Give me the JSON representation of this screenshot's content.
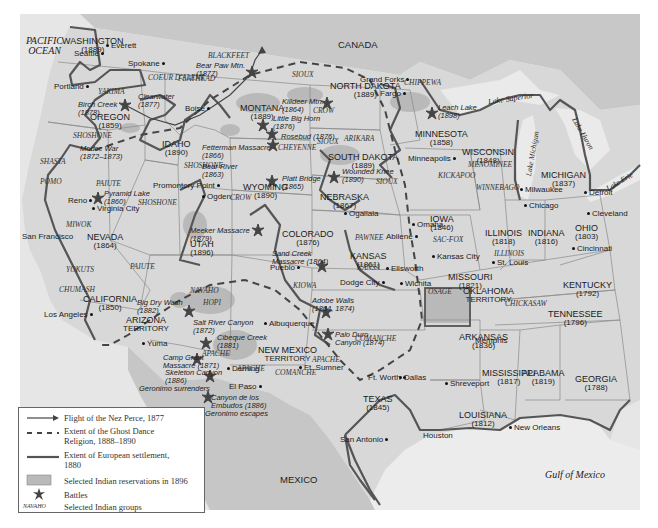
{
  "map": {
    "colors": {
      "land": "#d9d9d9",
      "water": "#ebebeb",
      "outside": "#c9c9c9",
      "reservation": "#b5b5b5",
      "settlement_line": "#555555",
      "border": "#8a8a8a"
    },
    "oceans": {
      "pacific_line1": "PACIFIC",
      "pacific_line2": "OCEAN",
      "gulf": "Gulf of Mexico"
    },
    "countries": {
      "canada": "CANADA",
      "mexico": "MEXICO"
    },
    "lakes": {
      "superior": "Lake Superior",
      "michigan": "Lake Michigan",
      "huron": "Lake Huron",
      "erie": "Lake Erie"
    },
    "states": [
      {
        "name": "WASHINGTON",
        "year": "(1889)",
        "x": 62,
        "y": 37
      },
      {
        "name": "OREGON",
        "year": "(1859)",
        "x": 90,
        "y": 113
      },
      {
        "name": "IDAHO",
        "year": "(1890)",
        "x": 162,
        "y": 140
      },
      {
        "name": "MONTANA",
        "year": "(1889)",
        "x": 240,
        "y": 104
      },
      {
        "name": "WYOMING",
        "year": "(1890)",
        "x": 243,
        "y": 183
      },
      {
        "name": "NORTH DAKOTA",
        "year": "(1889)",
        "x": 330,
        "y": 82
      },
      {
        "name": "SOUTH DAKOTA",
        "year": "(1889)",
        "x": 328,
        "y": 153
      },
      {
        "name": "NEBRASKA",
        "year": "(1867)",
        "x": 320,
        "y": 193
      },
      {
        "name": "MINNESOTA",
        "year": "(1858)",
        "x": 415,
        "y": 130
      },
      {
        "name": "WISCONSIN",
        "year": "(1848)",
        "x": 462,
        "y": 148
      },
      {
        "name": "MICHIGAN",
        "year": "(1837)",
        "x": 541,
        "y": 171
      },
      {
        "name": "IOWA",
        "year": "(1846)",
        "x": 430,
        "y": 215
      },
      {
        "name": "ILLINOIS",
        "year": "(1818)",
        "x": 485,
        "y": 229
      },
      {
        "name": "INDIANA",
        "year": "(1816)",
        "x": 528,
        "y": 229
      },
      {
        "name": "OHIO",
        "year": "(1803)",
        "x": 575,
        "y": 224
      },
      {
        "name": "NEVADA",
        "year": "(1864)",
        "x": 87,
        "y": 233
      },
      {
        "name": "UTAH",
        "year": "(1896)",
        "x": 190,
        "y": 240
      },
      {
        "name": "COLORADO",
        "year": "(1876)",
        "x": 282,
        "y": 230
      },
      {
        "name": "KANSAS",
        "year": "(1861)",
        "x": 350,
        "y": 252
      },
      {
        "name": "MISSOURI",
        "year": "(1821)",
        "x": 448,
        "y": 273
      },
      {
        "name": "KENTUCKY",
        "year": "(1792)",
        "x": 563,
        "y": 281
      },
      {
        "name": "TENNESSEE",
        "year": "(1796)",
        "x": 548,
        "y": 310
      },
      {
        "name": "CALIFORNIA",
        "year": "(1850)",
        "x": 83,
        "y": 295
      },
      {
        "name": "ARIZONA",
        "year": "TERRITORY",
        "x": 123,
        "y": 316
      },
      {
        "name": "OKLAHOMA",
        "year": "TERRITORY",
        "x": 463,
        "y": 287
      },
      {
        "name": "ARKANSAS",
        "year": "(1836)",
        "x": 459,
        "y": 333
      },
      {
        "name": "NEW MEXICO",
        "year": "TERRITORY",
        "x": 258,
        "y": 346
      },
      {
        "name": "MISSISSIPPI",
        "year": "(1817)",
        "x": 482,
        "y": 369
      },
      {
        "name": "ALABAMA",
        "year": "(1819)",
        "x": 522,
        "y": 369
      },
      {
        "name": "GEORGIA",
        "year": "(1788)",
        "x": 575,
        "y": 375
      },
      {
        "name": "TEXAS",
        "year": "(1845)",
        "x": 363,
        "y": 395
      },
      {
        "name": "LOUISIANA",
        "year": "(1812)",
        "x": 459,
        "y": 411
      }
    ],
    "cities": [
      {
        "name": "Everett",
        "x": 104,
        "y": 42,
        "dot": "left"
      },
      {
        "name": "Seattle",
        "x": 74,
        "y": 50,
        "dot": "right"
      },
      {
        "name": "Spokane",
        "x": 128,
        "y": 60,
        "dot": "right"
      },
      {
        "name": "Portland",
        "x": 54,
        "y": 83,
        "dot": "right"
      },
      {
        "name": "Boise",
        "x": 185,
        "y": 105,
        "dot": "right"
      },
      {
        "name": "Grand Forks",
        "x": 360,
        "y": 76,
        "dot": "right"
      },
      {
        "name": "Fargo",
        "x": 380,
        "y": 90,
        "dot": "right"
      },
      {
        "name": "Minneapolis",
        "x": 408,
        "y": 155,
        "dot": "right"
      },
      {
        "name": "Milwaukee",
        "x": 518,
        "y": 186,
        "dot": "left"
      },
      {
        "name": "Chicago",
        "x": 522,
        "y": 202,
        "dot": "left"
      },
      {
        "name": "Detroit",
        "x": 582,
        "y": 189,
        "dot": "left"
      },
      {
        "name": "Cleveland",
        "x": 585,
        "y": 210,
        "dot": "left"
      },
      {
        "name": "Omaha",
        "x": 410,
        "y": 221,
        "dot": "left"
      },
      {
        "name": "Kansas City",
        "x": 430,
        "y": 253,
        "dot": "left"
      },
      {
        "name": "St. Louis",
        "x": 490,
        "y": 259,
        "dot": "left"
      },
      {
        "name": "Cincinnati",
        "x": 570,
        "y": 245,
        "dot": "left"
      },
      {
        "name": "Promontory Point",
        "x": 153,
        "y": 182,
        "dot": "right"
      },
      {
        "name": "Ogden",
        "x": 200,
        "y": 193,
        "dot": "left"
      },
      {
        "name": "Reno",
        "x": 68,
        "y": 197,
        "dot": "right"
      },
      {
        "name": "Virginia City",
        "x": 90,
        "y": 205,
        "dot": "left"
      },
      {
        "name": "San Francisco",
        "x": 22,
        "y": 233,
        "dot": "top"
      },
      {
        "name": "Pueblo",
        "x": 270,
        "y": 264,
        "dot": "right"
      },
      {
        "name": "Ogallala",
        "x": 342,
        "y": 210,
        "dot": "left"
      },
      {
        "name": "Abilene",
        "x": 386,
        "y": 233,
        "dot": "right"
      },
      {
        "name": "Ellsworth",
        "x": 384,
        "y": 265,
        "dot": "left"
      },
      {
        "name": "Wichita",
        "x": 398,
        "y": 280,
        "dot": "left"
      },
      {
        "name": "Dodge City",
        "x": 340,
        "y": 279,
        "dot": "right"
      },
      {
        "name": "Los Angeles",
        "x": 44,
        "y": 311,
        "dot": "right"
      },
      {
        "name": "Yuma",
        "x": 140,
        "y": 340,
        "dot": "left"
      },
      {
        "name": "Albuquerque",
        "x": 262,
        "y": 320,
        "dot": "left"
      },
      {
        "name": "Deming",
        "x": 225,
        "y": 365,
        "dot": "left"
      },
      {
        "name": "El Paso",
        "x": 229,
        "y": 383,
        "dot": "right"
      },
      {
        "name": "Ft. Sumner",
        "x": 297,
        "y": 364,
        "dot": "left"
      },
      {
        "name": "Ft. Worth",
        "x": 368,
        "y": 374,
        "dot": "right"
      },
      {
        "name": "Dallas",
        "x": 397,
        "y": 374,
        "dot": "left"
      },
      {
        "name": "Shreveport",
        "x": 443,
        "y": 380,
        "dot": "left"
      },
      {
        "name": "Memphis",
        "x": 475,
        "y": 337,
        "dot": "top"
      },
      {
        "name": "San Antonio",
        "x": 340,
        "y": 436,
        "dot": "right"
      },
      {
        "name": "Houston",
        "x": 423,
        "y": 432,
        "dot": "top"
      },
      {
        "name": "New Orleans",
        "x": 507,
        "y": 424,
        "dot": "left"
      }
    ],
    "groups": [
      {
        "name": "BLACKFEET",
        "x": 208,
        "y": 52
      },
      {
        "name": "FLATHEAD",
        "x": 178,
        "y": 75
      },
      {
        "name": "COEUR D'ALENE",
        "x": 148,
        "y": 74
      },
      {
        "name": "YAKIMA",
        "x": 98,
        "y": 88
      },
      {
        "name": "SIOUX",
        "x": 292,
        "y": 71
      },
      {
        "name": "CROW",
        "x": 313,
        "y": 107
      },
      {
        "name": "SIOUX",
        "x": 317,
        "y": 138
      },
      {
        "name": "CHEYENNE",
        "x": 278,
        "y": 144
      },
      {
        "name": "ARIKARA",
        "x": 344,
        "y": 135
      },
      {
        "name": "CHIPPEWA",
        "x": 404,
        "y": 79
      },
      {
        "name": "SHOSHONE",
        "x": 73,
        "y": 132
      },
      {
        "name": "SHOSHONE",
        "x": 184,
        "y": 162
      },
      {
        "name": "SHASTA",
        "x": 40,
        "y": 158
      },
      {
        "name": "POMO",
        "x": 40,
        "y": 178
      },
      {
        "name": "PAIUTE",
        "x": 96,
        "y": 180
      },
      {
        "name": "SHOSHONE",
        "x": 138,
        "y": 199
      },
      {
        "name": "CROW",
        "x": 230,
        "y": 194
      },
      {
        "name": "MENOMINEE",
        "x": 468,
        "y": 161
      },
      {
        "name": "KICKAPOO",
        "x": 438,
        "y": 172
      },
      {
        "name": "WINNEBAGO",
        "x": 476,
        "y": 184
      },
      {
        "name": "SIOUX",
        "x": 376,
        "y": 178
      },
      {
        "name": "MIWOK",
        "x": 66,
        "y": 221
      },
      {
        "name": "PAIUTE",
        "x": 130,
        "y": 263
      },
      {
        "name": "YOKUTS",
        "x": 66,
        "y": 266
      },
      {
        "name": "CHUMASH",
        "x": 59,
        "y": 286
      },
      {
        "name": "PAWNEE",
        "x": 355,
        "y": 234
      },
      {
        "name": "SAC-FOX",
        "x": 433,
        "y": 236
      },
      {
        "name": "ILLINOIS",
        "x": 494,
        "y": 250
      },
      {
        "name": "KANSA",
        "x": 357,
        "y": 264
      },
      {
        "name": "OSAGE",
        "x": 428,
        "y": 288
      },
      {
        "name": "KIOWA",
        "x": 293,
        "y": 282
      },
      {
        "name": "NAVAHO",
        "x": 190,
        "y": 287
      },
      {
        "name": "HOPI",
        "x": 203,
        "y": 299
      },
      {
        "name": "CHICKASAW",
        "x": 505,
        "y": 300
      },
      {
        "name": "APACHE",
        "x": 202,
        "y": 350
      },
      {
        "name": "APACHE",
        "x": 237,
        "y": 365
      },
      {
        "name": "COMANCHE",
        "x": 275,
        "y": 369
      },
      {
        "name": "APACHE",
        "x": 312,
        "y": 356
      },
      {
        "name": "COMANCHE",
        "x": 355,
        "y": 335
      },
      {
        "name": "CHEROKEE",
        "x": 0,
        "y": 0
      }
    ],
    "battles": [
      {
        "name": "Bear Paw Mtn.",
        "year": "(1877)",
        "x": 196,
        "y": 62,
        "sx": 252,
        "sy": 72
      },
      {
        "name": "Clearwater",
        "year": "(1877)",
        "x": 138,
        "y": 93,
        "sx": 0,
        "sy": 0
      },
      {
        "name": "Birch Creek",
        "year": "(1878)",
        "x": 78,
        "y": 101,
        "sx": 125,
        "sy": 105
      },
      {
        "name": "Killdeer Mtn.",
        "year": "(1864)",
        "x": 282,
        "y": 98,
        "sx": 327,
        "sy": 103
      },
      {
        "name": "Little Big Horn",
        "year": "(1876)",
        "x": 273,
        "y": 115,
        "sx": 263,
        "sy": 125
      },
      {
        "name": "Rosebud (1876)",
        "year": "",
        "x": 281,
        "y": 133,
        "sx": 272,
        "sy": 134
      },
      {
        "name": "Fetterman Massacre",
        "year": "(1866)",
        "x": 202,
        "y": 144,
        "sx": 273,
        "sy": 145
      },
      {
        "name": "Leach Lake",
        "year": "(1898)",
        "x": 438,
        "y": 104,
        "sx": 432,
        "sy": 113
      },
      {
        "name": "Modoc War",
        "year": "(1872–1873)",
        "x": 80,
        "y": 145,
        "sx": 0,
        "sy": 0
      },
      {
        "name": "Bear River",
        "year": "(1863)",
        "x": 202,
        "y": 163,
        "sx": 0,
        "sy": 0
      },
      {
        "name": "Platt Bridge",
        "year": "(1865)",
        "x": 282,
        "y": 175,
        "sx": 272,
        "sy": 181
      },
      {
        "name": "Wounded Knee",
        "year": "(1890)",
        "x": 342,
        "y": 168,
        "sx": 334,
        "sy": 177
      },
      {
        "name": "Pyramid Lake",
        "year": "(1860)",
        "x": 104,
        "y": 190,
        "sx": 98,
        "sy": 198
      },
      {
        "name": "Meeker Massacre",
        "year": "(1879)",
        "x": 190,
        "y": 227,
        "sx": 258,
        "sy": 230
      },
      {
        "name": "Sand Creek",
        "year": "Massacre (1864)",
        "x": 272,
        "y": 250,
        "sx": 322,
        "sy": 266
      },
      {
        "name": "Adobe Walls",
        "year": "(1864, 1874)",
        "x": 312,
        "y": 297,
        "sx": 326,
        "sy": 312
      },
      {
        "name": "Big Dry Wash",
        "year": "(1882)",
        "x": 137,
        "y": 299,
        "sx": 189,
        "sy": 311
      },
      {
        "name": "Salt River Canyon",
        "year": "(1872)",
        "x": 193,
        "y": 319,
        "sx": 0,
        "sy": 0
      },
      {
        "name": "Cibeque Creek",
        "year": "(1881)",
        "x": 217,
        "y": 334,
        "sx": 206,
        "sy": 343
      },
      {
        "name": "Palo Duro",
        "year": "Canyon (1874)",
        "x": 335,
        "y": 331,
        "sx": 328,
        "sy": 334
      },
      {
        "name": "Camp Grant",
        "year": "Massacre (1871)",
        "x": 163,
        "y": 354,
        "sx": 197,
        "sy": 359
      },
      {
        "name": "Skeleton Canyon",
        "year": "(1886)",
        "x": 165,
        "y": 369,
        "sx": 210,
        "sy": 376
      },
      {
        "name": "Geronimo surrenders",
        "year": "",
        "x": 139,
        "y": 385,
        "sx": 0,
        "sy": 0
      },
      {
        "name": "Canyon de los",
        "year": "Embudos (1886)",
        "x": 211,
        "y": 394,
        "sx": 208,
        "sy": 397
      },
      {
        "name": "Geronimo escapes",
        "year": "",
        "x": 205,
        "y": 410,
        "sx": 0,
        "sy": 0
      }
    ]
  },
  "legend": {
    "items": [
      {
        "label_line1": "Flight of the Nez Perce, 1877",
        "label_line2": ""
      },
      {
        "label_line1": "Extent of the Ghost Dance",
        "label_line2": "Religion, 1888–1890"
      },
      {
        "label_line1": "Extent of European settlement,",
        "label_line2": "1880"
      },
      {
        "label_line1": "Selected Indian reservations in 1896",
        "label_line2": ""
      },
      {
        "label_line1": "Battles",
        "label_line2": ""
      },
      {
        "label_line1": "Selected Indian groups",
        "label_line2": ""
      }
    ],
    "group_sample": "NAVAHO"
  }
}
